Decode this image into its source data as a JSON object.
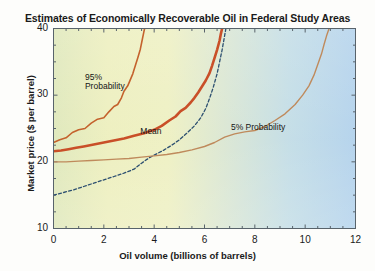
{
  "chart_data": {
    "type": "line",
    "title": "Estimates of Economically Recoverable Oil in Federal Study Areas",
    "xlabel": "Oil volume (billions of barrels)",
    "ylabel": "Market price ($ per barrel)",
    "xlim": [
      0,
      12
    ],
    "ylim": [
      10,
      40
    ],
    "xticks": [
      0,
      2,
      4,
      6,
      8,
      10,
      12
    ],
    "yticks": [
      10,
      20,
      30,
      40
    ],
    "xtick_labels": [
      "0",
      "2",
      "4",
      "6",
      "8",
      "10",
      "12"
    ],
    "ytick_labels": [
      "10",
      "20",
      "30",
      "40"
    ],
    "grid": false,
    "legend": "inline-annotations",
    "background_gradient": [
      "#e8edbe",
      "#f2f3c4",
      "#e4eccd",
      "#cfe2e4",
      "#b9d6ec"
    ],
    "series": [
      {
        "name": "95% Probability",
        "color": "#c4622d",
        "style": "solid",
        "width": 1.6,
        "label": "95%\nProbability",
        "x": [
          0.0,
          0.25,
          0.5,
          0.75,
          1.0,
          1.25,
          1.5,
          1.75,
          2.0,
          2.2,
          2.4,
          2.55,
          2.7,
          2.8,
          2.95,
          3.05,
          3.15,
          3.25,
          3.35,
          3.45,
          3.52,
          3.58,
          3.62
        ],
        "y": [
          22.9,
          23.3,
          23.6,
          24.4,
          24.8,
          25.0,
          25.8,
          26.4,
          26.6,
          27.5,
          28.3,
          28.6,
          29.6,
          30.6,
          31.4,
          32.3,
          33.2,
          34.4,
          35.6,
          36.9,
          38.2,
          39.3,
          40.0
        ]
      },
      {
        "name": "Mean",
        "color": "#c94f28",
        "style": "solid",
        "width": 2.6,
        "label": "Mean",
        "x": [
          0.0,
          0.3,
          0.6,
          0.9,
          1.2,
          1.6,
          2.0,
          2.4,
          2.8,
          3.2,
          3.6,
          4.0,
          4.3,
          4.6,
          4.85,
          5.05,
          5.25,
          5.45,
          5.6,
          5.75,
          5.9,
          6.05,
          6.2,
          6.3,
          6.4,
          6.5,
          6.6,
          6.65,
          6.7
        ],
        "y": [
          21.6,
          21.7,
          21.9,
          22.1,
          22.3,
          22.6,
          22.9,
          23.2,
          23.5,
          23.9,
          24.3,
          24.8,
          25.4,
          26.2,
          26.8,
          27.6,
          28.1,
          28.9,
          29.6,
          30.4,
          31.3,
          32.2,
          33.3,
          34.4,
          35.6,
          36.8,
          38.2,
          39.2,
          40.0
        ]
      },
      {
        "name": "Median (dashed)",
        "color": "#2c4f70",
        "style": "dashed",
        "width": 1.3,
        "x": [
          0.0,
          0.4,
          0.8,
          1.2,
          1.6,
          2.0,
          2.4,
          2.8,
          3.2,
          3.5,
          3.8,
          4.1,
          4.4,
          4.7,
          5.0,
          5.3,
          5.6,
          5.85,
          6.05,
          6.2,
          6.35,
          6.5,
          6.6,
          6.7,
          6.78,
          6.85
        ],
        "y": [
          15.0,
          15.4,
          15.8,
          16.3,
          16.8,
          17.3,
          17.8,
          18.3,
          18.9,
          19.8,
          20.6,
          21.2,
          21.8,
          22.5,
          23.3,
          24.3,
          25.4,
          26.6,
          28.0,
          29.5,
          31.2,
          33.2,
          35.0,
          36.8,
          38.5,
          40.0
        ]
      },
      {
        "name": "5% Probability",
        "color": "#bf8a5c",
        "style": "solid",
        "width": 1.4,
        "label": "5% Probability",
        "x": [
          0.0,
          0.5,
          1.0,
          1.5,
          2.0,
          2.5,
          3.0,
          3.5,
          4.0,
          4.5,
          5.0,
          5.5,
          6.0,
          6.4,
          6.8,
          7.2,
          7.6,
          8.0,
          8.4,
          8.8,
          9.2,
          9.6,
          9.9,
          10.15,
          10.35,
          10.5,
          10.65,
          10.75,
          10.85,
          10.95
        ],
        "y": [
          20.0,
          20.0,
          20.1,
          20.2,
          20.3,
          20.4,
          20.5,
          20.7,
          20.9,
          21.1,
          21.4,
          21.8,
          22.3,
          22.9,
          23.7,
          24.2,
          24.5,
          24.7,
          25.3,
          26.2,
          27.2,
          28.6,
          30.0,
          31.4,
          33.0,
          34.6,
          36.2,
          37.6,
          38.9,
          40.0
        ]
      }
    ],
    "annotations": [
      {
        "text_line1": "95%",
        "text_line2": "Probability",
        "x": 1.25,
        "y": 32.5
      },
      {
        "text": "Mean",
        "x": 3.45,
        "y": 24.5
      },
      {
        "text": "5% Probability",
        "x": 7.05,
        "y": 25.1
      }
    ]
  }
}
